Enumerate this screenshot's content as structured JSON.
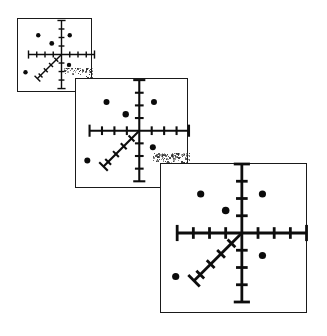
{
  "figure": {
    "title": "Sequence of three overlapping scatter panels with 3D coordinate axes",
    "background_color": "#ffffff",
    "ink_color": "#0d0d0d",
    "panel_border_color": "#1a1a1a",
    "point_color": "#0b0b0b",
    "panel_count": 3,
    "canvas": {
      "width": 327,
      "height": 336
    }
  },
  "chart_data": {
    "type": "scatter",
    "title": "Sequence of three overlapping scatter panels with 3D coordinate axes",
    "xlabel": "",
    "ylabel": "",
    "grid": false,
    "legend": null,
    "axis_style": "three-axis 3D cross (x horizontal, y vertical, z diagonal) with tick marks",
    "panels": [
      {
        "name": "panel-1",
        "label": "Panel 1",
        "scale": 1.0,
        "frame": {
          "x": 17,
          "y": 18,
          "width": 75,
          "height": 74
        },
        "origin": {
          "x": 0.58,
          "y": 0.48
        },
        "axes": {
          "x": {
            "half_length": 0.44,
            "ticks_per_side": 3,
            "end_caps": true
          },
          "y": {
            "half_length": 0.46,
            "ticks_per_side": 3,
            "end_caps": true
          },
          "z": {
            "length": 0.46,
            "angle_deg": 225,
            "ticks": 4,
            "end_cap": true
          }
        },
        "points": [
          {
            "id": "p1",
            "x": 0.27,
            "y": 0.22,
            "r": 2.2
          },
          {
            "id": "p2",
            "x": 0.69,
            "y": 0.22,
            "r": 2.2
          },
          {
            "id": "p3",
            "x": 0.45,
            "y": 0.33,
            "r": 2.4
          },
          {
            "id": "p4",
            "x": 0.68,
            "y": 0.62,
            "r": 2.2
          },
          {
            "id": "p5",
            "x": 0.1,
            "y": 0.72,
            "r": 2.2
          },
          {
            "id": "p6",
            "x": 0.58,
            "y": 0.48,
            "r": 0.0
          }
        ]
      },
      {
        "name": "panel-2",
        "label": "Panel 2",
        "scale": 1.5,
        "frame": {
          "x": 75,
          "y": 78,
          "width": 113,
          "height": 110
        },
        "origin": {
          "x": 0.56,
          "y": 0.47
        },
        "axes": {
          "x": {
            "half_length": 0.44,
            "ticks_per_side": 3,
            "end_caps": true
          },
          "y": {
            "half_length": 0.46,
            "ticks_per_side": 3,
            "end_caps": true
          },
          "z": {
            "length": 0.46,
            "angle_deg": 225,
            "ticks": 4,
            "end_cap": true
          }
        },
        "points": [
          {
            "id": "p1",
            "x": 0.27,
            "y": 0.21,
            "r": 3.0
          },
          {
            "id": "p2",
            "x": 0.69,
            "y": 0.21,
            "r": 3.0
          },
          {
            "id": "p3",
            "x": 0.44,
            "y": 0.32,
            "r": 3.2
          },
          {
            "id": "p4",
            "x": 0.68,
            "y": 0.62,
            "r": 3.0
          },
          {
            "id": "p5",
            "x": 0.1,
            "y": 0.74,
            "r": 3.0
          },
          {
            "id": "p6",
            "x": 0.56,
            "y": 0.47,
            "r": 0.0
          }
        ]
      },
      {
        "name": "panel-3",
        "label": "Panel 3",
        "scale": 2.0,
        "frame": {
          "x": 160,
          "y": 163,
          "width": 147,
          "height": 150
        },
        "origin": {
          "x": 0.55,
          "y": 0.46
        },
        "axes": {
          "x": {
            "half_length": 0.44,
            "ticks_per_side": 3,
            "end_caps": true
          },
          "y": {
            "half_length": 0.46,
            "ticks_per_side": 3,
            "end_caps": true
          },
          "z": {
            "length": 0.46,
            "angle_deg": 225,
            "ticks": 4,
            "end_cap": true
          }
        },
        "points": [
          {
            "id": "p1",
            "x": 0.27,
            "y": 0.2,
            "r": 3.6
          },
          {
            "id": "p2",
            "x": 0.69,
            "y": 0.2,
            "r": 3.6
          },
          {
            "id": "p3",
            "x": 0.44,
            "y": 0.31,
            "r": 3.8
          },
          {
            "id": "p4",
            "x": 0.69,
            "y": 0.61,
            "r": 3.6
          },
          {
            "id": "p5",
            "x": 0.1,
            "y": 0.75,
            "r": 3.6
          },
          {
            "id": "p6",
            "x": 0.55,
            "y": 0.46,
            "r": 0.0
          }
        ]
      }
    ],
    "overlap_artifacts": [
      {
        "name": "noise-corner-1",
        "x": 63,
        "y": 68,
        "width": 30,
        "height": 26
      },
      {
        "name": "noise-corner-2",
        "x": 152,
        "y": 153,
        "width": 38,
        "height": 36
      }
    ]
  }
}
